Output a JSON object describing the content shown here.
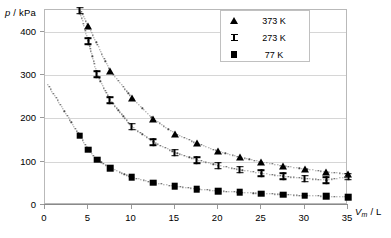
{
  "chart_data": {
    "type": "scatter",
    "title": "",
    "xlabel": "Vm / L",
    "ylabel": "p / kPa",
    "xlim": [
      0,
      35
    ],
    "ylim": [
      0,
      450
    ],
    "grid": true,
    "legend_position": "top-right",
    "xticks": [
      "0",
      "5",
      "10",
      "15",
      "20",
      "25",
      "30",
      "35"
    ],
    "xtick_values": [
      0,
      5,
      10,
      15,
      20,
      25,
      30,
      35
    ],
    "yticks": [
      "0",
      "100",
      "200",
      "300",
      "400"
    ],
    "ytick_values": [
      0,
      100,
      200,
      300,
      400
    ],
    "series": [
      {
        "name": "373 K",
        "marker": "triangle",
        "color": "#000000",
        "x": [
          5.0,
          7.5,
          10.0,
          12.5,
          15.0,
          17.5,
          20.0,
          22.5,
          25.0,
          27.5,
          30.0,
          32.5,
          35.0
        ],
        "y": [
          413,
          310,
          248,
          198,
          165,
          142,
          124,
          110,
          99,
          90,
          83,
          76,
          71
        ]
      },
      {
        "name": "273 K",
        "marker": "ibeam",
        "color": "#000000",
        "x": [
          4.0,
          5.0,
          6.0,
          7.5,
          10.0,
          12.5,
          15.0,
          17.5,
          20.0,
          22.5,
          25.0,
          27.5,
          30.0,
          32.5,
          35.0
        ],
        "y": [
          448,
          378,
          302,
          242,
          181,
          145,
          121,
          104,
          91,
          81,
          73,
          66,
          61,
          57,
          65
        ]
      },
      {
        "name": "77 K",
        "marker": "square",
        "color": "#000000",
        "x": [
          4.0,
          5.0,
          6.0,
          7.5,
          10.0,
          12.5,
          15.0,
          17.5,
          20.0,
          22.5,
          25.0,
          27.5,
          30.0,
          32.5,
          35.0
        ],
        "y": [
          160,
          128,
          105,
          85,
          64,
          51,
          43,
          37,
          32,
          29,
          26,
          24,
          21,
          20,
          18
        ]
      }
    ]
  },
  "legend": {
    "entries": [
      {
        "label": "373 K",
        "marker": "triangle"
      },
      {
        "label": "273 K",
        "marker": "ibeam"
      },
      {
        "label": "77 K",
        "marker": "square"
      }
    ]
  },
  "axes": {
    "y_title_main": "p",
    "y_title_rest": " / kPa",
    "x_title_main": "V",
    "x_title_sub": "m",
    "x_title_rest": " / L"
  }
}
